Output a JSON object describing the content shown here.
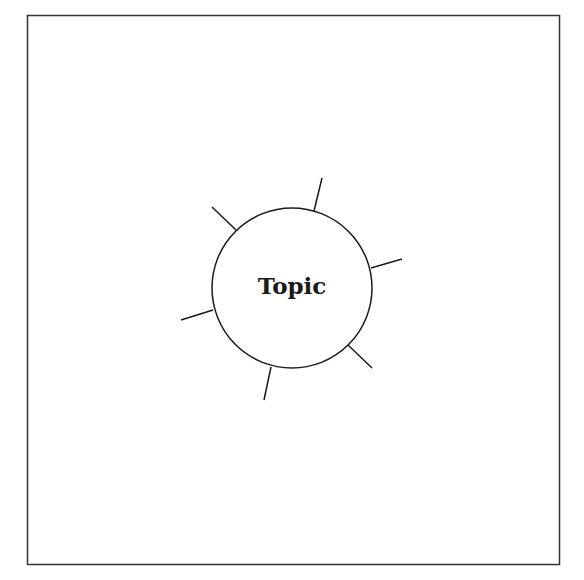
{
  "diagram": {
    "type": "mind-map-template",
    "center_label": "Topic",
    "frame": {
      "x": 27,
      "y": 15,
      "width": 532,
      "height": 549,
      "stroke": "#333333"
    },
    "circle": {
      "cx": 292,
      "cy": 288,
      "r": 80,
      "stroke": "#1a1a1a",
      "fill": "#ffffff"
    },
    "spokes": [
      {
        "name": "spoke-top",
        "x1": 314,
        "y1": 211,
        "x2": 322,
        "y2": 178
      },
      {
        "name": "spoke-upper-left",
        "x1": 236,
        "y1": 230,
        "x2": 212,
        "y2": 207
      },
      {
        "name": "spoke-right",
        "x1": 371,
        "y1": 268,
        "x2": 402,
        "y2": 259
      },
      {
        "name": "spoke-left",
        "x1": 213,
        "y1": 310,
        "x2": 181,
        "y2": 320
      },
      {
        "name": "spoke-lower-right",
        "x1": 348,
        "y1": 345,
        "x2": 372,
        "y2": 368
      },
      {
        "name": "spoke-bottom",
        "x1": 271,
        "y1": 367,
        "x2": 264,
        "y2": 400
      }
    ],
    "colors": {
      "line": "#1a1a1a",
      "background": "#ffffff"
    }
  }
}
